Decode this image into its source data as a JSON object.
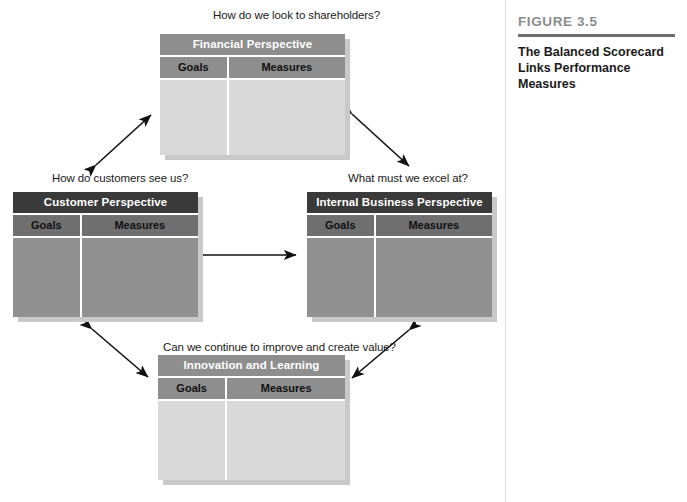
{
  "figure": {
    "number": "FIGURE 3.5",
    "title": "The Balanced Scorecard Links Performance Measures"
  },
  "diagram": {
    "type": "balanced-scorecard",
    "column_headers": [
      "Goals",
      "Measures"
    ],
    "perspectives": [
      {
        "id": "financial",
        "title": "Financial Perspective",
        "question": "How do we look to shareholders?",
        "position": "top",
        "tone": "light",
        "columns": [
          "Goals",
          "Measures"
        ],
        "goals": "",
        "measures": ""
      },
      {
        "id": "customer",
        "title": "Customer Perspective",
        "question": "How do customers see us?",
        "position": "left",
        "tone": "dark",
        "columns": [
          "Goals",
          "Measures"
        ],
        "goals": "",
        "measures": ""
      },
      {
        "id": "internal-business",
        "title": "Internal Business Perspective",
        "question": "What must we excel at?",
        "position": "right",
        "tone": "dark",
        "columns": [
          "Goals",
          "Measures"
        ],
        "goals": "",
        "measures": ""
      },
      {
        "id": "innovation-learning",
        "title": "Innovation and Learning Perspective",
        "question": "Can we continue to improve and create value?",
        "position": "bottom",
        "tone": "light",
        "columns": [
          "Goals",
          "Measures"
        ],
        "goals": "",
        "measures": ""
      }
    ],
    "connectors": [
      {
        "id": "financial-customer",
        "from": "financial",
        "to": "customer",
        "style": "double-headed-arrow"
      },
      {
        "id": "financial-internal",
        "from": "financial",
        "to": "internal-business",
        "style": "double-headed-arrow"
      },
      {
        "id": "customer-internal",
        "from": "customer",
        "to": "internal-business",
        "style": "double-headed-arrow"
      },
      {
        "id": "customer-innovation",
        "from": "customer",
        "to": "innovation-learning",
        "style": "double-headed-arrow"
      },
      {
        "id": "internal-innovation",
        "from": "internal-business",
        "to": "innovation-learning",
        "style": "double-headed-arrow"
      }
    ]
  },
  "colors": {
    "header_light": "#8e8e8e",
    "header_dark": "#3a3a3a",
    "body_light": "#d9d9d9",
    "body_dark": "#909090",
    "shadow": "#c9c9c9",
    "figure_number": "#8c8c8c",
    "rule": "#6e6e6e"
  }
}
